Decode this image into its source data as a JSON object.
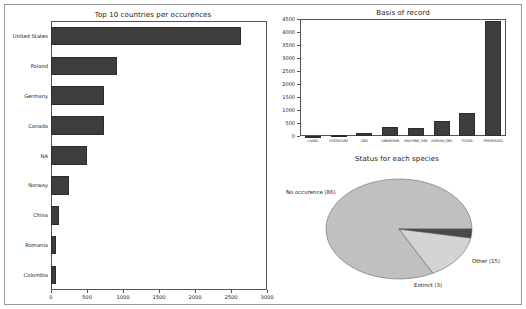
{
  "figure": {
    "background": "#ffffff",
    "frame_color": "#9a9a9a",
    "bar_color": "#3d3d3d",
    "pie_main_color": "#c0c0c0",
    "pie_other_color": "#d4d4d4",
    "pie_extinct_color": "#4a4a4a"
  },
  "chart_data": [
    {
      "type": "bar",
      "orientation": "horizontal",
      "title": "Top 10 countries per occurences",
      "xlabel": "",
      "ylabel": "",
      "categories": [
        "United States",
        "Poland",
        "Germany",
        "Canada",
        "NA",
        "Norway",
        "China",
        "Romania",
        "Colombia"
      ],
      "values": [
        2640,
        920,
        730,
        740,
        500,
        250,
        110,
        70,
        70
      ],
      "xlim": [
        0,
        3000
      ],
      "xticks": [
        0,
        500,
        1000,
        1500,
        2000,
        2500,
        3000
      ],
      "xticklabels": [
        "0",
        "500",
        "1000",
        "1500",
        "2000",
        "2500",
        "3000"
      ],
      "grid": false,
      "legend": "none"
    },
    {
      "type": "bar",
      "orientation": "vertical",
      "title": "Basis of record",
      "xlabel": "",
      "ylabel": "",
      "categories": [
        "LIVING",
        "LITERATURE",
        "OBS",
        "UNKNOWN",
        "MACHINE_OBS",
        "HUMAN_OBS",
        "FOSSIL",
        "PRESERVED"
      ],
      "values": [
        5,
        20,
        110,
        330,
        320,
        580,
        900,
        4430
      ],
      "ylim": [
        0,
        4500
      ],
      "yticks": [
        0,
        500,
        1000,
        1500,
        2000,
        2500,
        3000,
        3500,
        4000,
        4500
      ],
      "yticklabels": [
        "0",
        "500",
        "1000",
        "1500",
        "2000",
        "2500",
        "3000",
        "3500",
        "4000",
        "4500"
      ],
      "grid": false,
      "legend": "none"
    },
    {
      "type": "pie",
      "title": "Status for each species",
      "labels": [
        "No occurence (86)",
        "Other (15)",
        "Extinct (3)"
      ],
      "values": [
        86,
        15,
        3
      ],
      "colors": [
        "#c0c0c0",
        "#d4d4d4",
        "#4a4a4a"
      ],
      "legend": "none",
      "label_positions": [
        "left",
        "right",
        "bottom"
      ]
    }
  ]
}
